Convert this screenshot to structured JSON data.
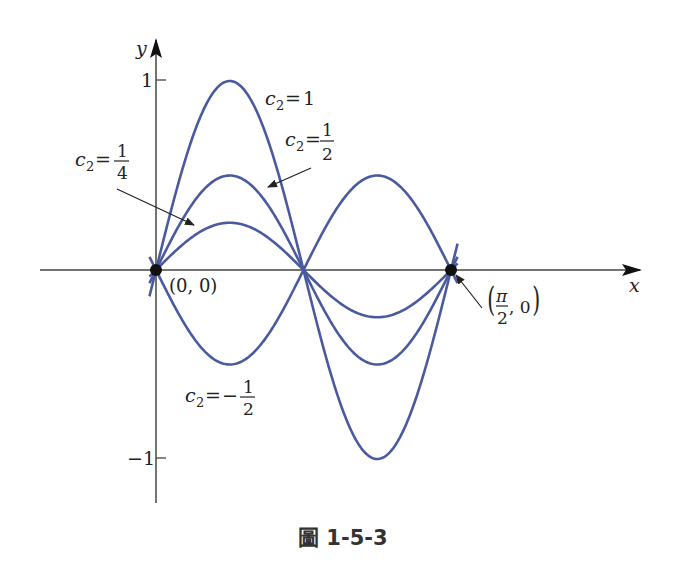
{
  "chart_data": {
    "type": "line",
    "title": "",
    "caption": "圖 1-5-3",
    "function": "y = c2 * sin(4x)",
    "xlabel": "x",
    "ylabel": "y",
    "xlim": [
      0,
      1.5708
    ],
    "ylim": [
      -1,
      1
    ],
    "y_ticks": [
      "1",
      "-1"
    ],
    "grid": false,
    "legend": "inline annotations",
    "series": [
      {
        "name": "c2=1",
        "c2": 1,
        "x": [
          0,
          0.3927,
          0.7854,
          1.1781,
          1.5708
        ],
        "values": [
          0,
          1,
          0,
          -1,
          0
        ]
      },
      {
        "name": "c2=1/2",
        "c2": 0.5,
        "x": [
          0,
          0.3927,
          0.7854,
          1.1781,
          1.5708
        ],
        "values": [
          0,
          0.5,
          0,
          -0.5,
          0
        ]
      },
      {
        "name": "c2=1/4",
        "c2": 0.25,
        "x": [
          0,
          0.3927,
          0.7854,
          1.1781,
          1.5708
        ],
        "values": [
          0,
          0.25,
          0,
          -0.25,
          0
        ]
      },
      {
        "name": "c2=-1/2",
        "c2": -0.5,
        "x": [
          0,
          0.3927,
          0.7854,
          1.1781,
          1.5708
        ],
        "values": [
          0,
          -0.5,
          0,
          0.5,
          0
        ]
      }
    ],
    "points": [
      {
        "label": "(0, 0)",
        "x": 0,
        "y": 0
      },
      {
        "label": "(π/2, 0)",
        "x": 1.5708,
        "y": 0
      }
    ],
    "annotations": [
      {
        "text": "c2=1"
      },
      {
        "text": "c2=1/2"
      },
      {
        "text": "c2=1/4"
      },
      {
        "text": "c2=-1/2"
      }
    ]
  },
  "labels": {
    "x_axis": "x",
    "y_axis": "y",
    "tick_pos": "1",
    "tick_neg": "−1",
    "origin": "(0, 0)",
    "c": "c",
    "sub2": "2",
    "eq": "=",
    "one": "1",
    "num1": "1",
    "den2": "2",
    "den4": "4",
    "minus": "−",
    "pi": "π",
    "pt_zero": ", 0",
    "caption": "圖 1-5-3"
  },
  "colors": {
    "curve": "#4a5a9e",
    "axis": "#444444",
    "point": "#111111"
  }
}
